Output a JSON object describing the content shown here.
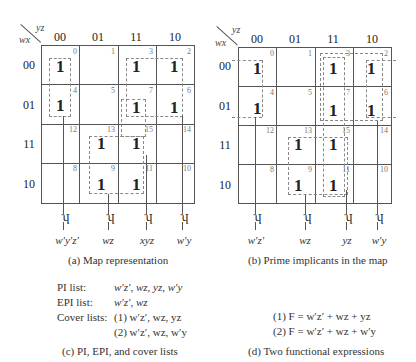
{
  "map_a": {
    "row_var": "wx",
    "col_var": "yz",
    "col_headers": [
      "00",
      "01",
      "11",
      "10"
    ],
    "row_headers": [
      "00",
      "01",
      "11",
      "10"
    ],
    "minterm_numbers": [
      [
        "0",
        "1",
        "3",
        "2"
      ],
      [
        "4",
        "5",
        "7",
        "6"
      ],
      [
        "12",
        "13",
        "15",
        "14"
      ],
      [
        "8",
        "9",
        "11",
        "10"
      ]
    ],
    "values": [
      [
        "1",
        "",
        "1",
        "1"
      ],
      [
        "1",
        "",
        "1",
        "1"
      ],
      [
        "",
        "1",
        "1",
        ""
      ],
      [
        "",
        "1",
        "1",
        ""
      ]
    ],
    "group_labels": [
      "w′y′z′",
      "wz",
      "xyz",
      "w′y"
    ],
    "caption": "(a)  Map representation"
  },
  "map_b": {
    "row_var": "wx",
    "col_var": "yz",
    "col_headers": [
      "00",
      "01",
      "11",
      "10"
    ],
    "row_headers": [
      "00",
      "01",
      "11",
      "10"
    ],
    "minterm_numbers": [
      [
        "0",
        "1",
        "3",
        "2"
      ],
      [
        "4",
        "5",
        "7",
        "6"
      ],
      [
        "12",
        "13",
        "15",
        "14"
      ],
      [
        "8",
        "9",
        "11",
        "10"
      ]
    ],
    "values": [
      [
        "1",
        "",
        "1",
        "1"
      ],
      [
        "1",
        "",
        "1",
        "1"
      ],
      [
        "",
        "1",
        "1",
        ""
      ],
      [
        "",
        "1",
        "1",
        ""
      ]
    ],
    "group_labels": [
      "w′z′",
      "wz",
      "yz",
      "w′y"
    ],
    "caption": "(b)  Prime implicants in the map"
  },
  "lists": {
    "pi_label": "PI list:",
    "pi_value": "w′z′, wz, yz, w′y",
    "epi_label": "EPI list:",
    "epi_value": "w′z′, wz",
    "cover_label": "Cover lists:",
    "cover_1": "(1) w′z′, wz, yz",
    "cover_2": "(2) w′z′, wz, w′y",
    "caption": "(c)  PI, EPI, and cover lists"
  },
  "expressions": {
    "expr_1": "(1) F = w′z′ + wz + yz",
    "expr_2": "(2) F = w′z′ + wz + w′y",
    "caption": "(d)  Two functional expressions"
  },
  "colors": {
    "grid_line": "#555555",
    "dashed_group": "#888888",
    "text": "#222222",
    "minterm_number": "#777777"
  }
}
